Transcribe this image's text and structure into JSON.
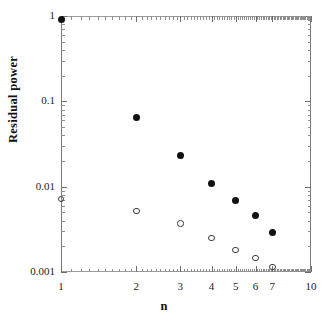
{
  "chart_data": {
    "type": "scatter",
    "title": "",
    "subtitle": "",
    "xlabel": "n",
    "ylabel": "Residual  power",
    "xscale": "log",
    "yscale": "log",
    "xlim": [
      1,
      10
    ],
    "ylim": [
      0.001,
      1
    ],
    "grid": false,
    "legend": "none",
    "frame": "box",
    "x_ticks": [
      {
        "value": 1,
        "label": "1"
      },
      {
        "value": 2,
        "label": "2"
      },
      {
        "value": 3,
        "label": "3"
      },
      {
        "value": 4,
        "label": "4"
      },
      {
        "value": 5,
        "label": "5"
      },
      {
        "value": 6,
        "label": "6"
      },
      {
        "value": 7,
        "label": "7"
      },
      {
        "value": 10,
        "label": "10"
      }
    ],
    "y_ticks": [
      {
        "value": 1,
        "label": "1"
      },
      {
        "value": 0.1,
        "label": "0.1"
      },
      {
        "value": 0.01,
        "label": "0.01"
      },
      {
        "value": 0.001,
        "label": "0.001"
      }
    ],
    "x": [
      1,
      2,
      3,
      4,
      5,
      6,
      7
    ],
    "series": [
      {
        "name": "filled-circles",
        "marker": "filled-circle",
        "color": "#111111",
        "values": [
          0.9,
          0.065,
          0.023,
          0.011,
          0.0068,
          0.0046,
          0.0029
        ]
      },
      {
        "name": "open-circles",
        "marker": "open-circle",
        "color": "#3a3a3a",
        "values": [
          0.0072,
          0.0052,
          0.0037,
          0.0025,
          0.0018,
          0.00145,
          0.00115
        ]
      }
    ],
    "annotations": []
  },
  "axis": {
    "x_title": "n",
    "y_title": "Residual  power"
  },
  "colors": {
    "background": "#ffffff",
    "frame": "#7a7a7a",
    "filled_marker": "#111111",
    "open_marker": "#3a3a3a",
    "text": "#1a1a1a"
  }
}
